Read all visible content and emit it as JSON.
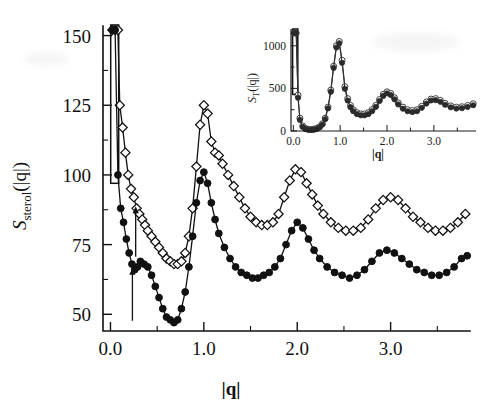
{
  "figure": {
    "name": "sterol-structure-factor-figure",
    "background_color": "#ffffff",
    "ink_color": "#111111"
  },
  "main_axes": {
    "y_label_symbol": "S",
    "y_label_subscript": "sterol",
    "y_label_arg": "(|q|)",
    "x_label": "|q|",
    "y_ticks": [
      "50",
      "75",
      "100",
      "125",
      "150"
    ],
    "x_ticks": [
      "0.0",
      "1.0",
      "2.0",
      "3.0"
    ],
    "y_tick_values": [
      50,
      75,
      100,
      125,
      150
    ],
    "x_tick_values": [
      0.0,
      1.0,
      2.0,
      3.0
    ],
    "x_minor_tick_values": [
      0.5,
      1.5,
      2.5,
      3.5
    ],
    "y_minor_tick_values": [
      62.5,
      87.5,
      112.5,
      137.5
    ],
    "xlim": [
      -0.08,
      3.85
    ],
    "ylim": [
      44,
      152
    ]
  },
  "inset_axes": {
    "y_label_symbol": "S",
    "y_label_subscript": "T",
    "y_label_arg": "(|q|)",
    "x_label": "|q|",
    "y_ticks": [
      "0",
      "500",
      "1000"
    ],
    "x_ticks": [
      "0.0",
      "1.0",
      "2.0",
      "3.0"
    ],
    "y_tick_values": [
      0,
      500,
      1000
    ],
    "x_tick_values": [
      0.0,
      1.0,
      2.0,
      3.0
    ],
    "x_minor_tick_values": [
      0.5,
      1.5,
      2.5,
      3.5
    ],
    "xlim": [
      -0.05,
      3.9
    ],
    "ylim": [
      0,
      1150
    ]
  },
  "annotations": {
    "arrow_open_series": {
      "label": "shoulder-arrow-upper",
      "x": 0.27,
      "y_tip": 88,
      "y_tail": 80
    },
    "arrow_filled_series": {
      "label": "shoulder-arrow-lower",
      "x": 0.235,
      "y_tip": 66,
      "y_tail": 57
    }
  },
  "chart_data": {
    "type": "line",
    "title": "",
    "xlabel": "|q|",
    "ylabel": "S_sterol(|q|)",
    "xlim": [
      -0.08,
      3.85
    ],
    "ylim": [
      44,
      152
    ],
    "grid": false,
    "legend": "none",
    "series": [
      {
        "name": "S_sterol open diamonds",
        "marker": "open-diamond",
        "clipped_above": 150,
        "x": [
          0.02,
          0.05,
          0.08,
          0.1,
          0.13,
          0.16,
          0.19,
          0.22,
          0.25,
          0.28,
          0.31,
          0.34,
          0.37,
          0.4,
          0.44,
          0.48,
          0.52,
          0.56,
          0.6,
          0.64,
          0.68,
          0.72,
          0.76,
          0.8,
          0.84,
          0.88,
          0.92,
          0.96,
          1.0,
          1.04,
          1.08,
          1.12,
          1.16,
          1.2,
          1.26,
          1.32,
          1.38,
          1.44,
          1.5,
          1.56,
          1.62,
          1.68,
          1.74,
          1.8,
          1.86,
          1.92,
          1.98,
          2.04,
          2.1,
          2.16,
          2.22,
          2.28,
          2.36,
          2.44,
          2.52,
          2.6,
          2.68,
          2.76,
          2.84,
          2.92,
          3.0,
          3.08,
          3.16,
          3.24,
          3.32,
          3.4,
          3.48,
          3.56,
          3.64,
          3.72,
          3.8
        ],
        "y": [
          152,
          152,
          152,
          125,
          117,
          108,
          100,
          95,
          92,
          88,
          86,
          84,
          82,
          80,
          78,
          76,
          74,
          72,
          70,
          69,
          68,
          68,
          69,
          72,
          78,
          88,
          103,
          118,
          125,
          122,
          112,
          108,
          107,
          104,
          100,
          96,
          92,
          88,
          85,
          83,
          82,
          82,
          83,
          86,
          92,
          98,
          102,
          101,
          97,
          93,
          89,
          86,
          83,
          81,
          80,
          80,
          81,
          84,
          88,
          91,
          92,
          91,
          88,
          85,
          83,
          81,
          80,
          80,
          81,
          83,
          86
        ]
      },
      {
        "name": "S_sterol filled circles",
        "marker": "filled-circle",
        "clipped_above": 150,
        "x": [
          0.02,
          0.05,
          0.08,
          0.11,
          0.14,
          0.17,
          0.2,
          0.23,
          0.26,
          0.29,
          0.32,
          0.36,
          0.4,
          0.44,
          0.48,
          0.52,
          0.56,
          0.6,
          0.64,
          0.68,
          0.72,
          0.76,
          0.8,
          0.84,
          0.88,
          0.92,
          0.96,
          1.0,
          1.04,
          1.08,
          1.12,
          1.16,
          1.22,
          1.28,
          1.34,
          1.4,
          1.46,
          1.52,
          1.58,
          1.64,
          1.7,
          1.76,
          1.82,
          1.88,
          1.94,
          2.0,
          2.06,
          2.12,
          2.18,
          2.24,
          2.32,
          2.4,
          2.48,
          2.56,
          2.64,
          2.72,
          2.8,
          2.88,
          2.96,
          3.04,
          3.12,
          3.2,
          3.28,
          3.36,
          3.44,
          3.52,
          3.6,
          3.68,
          3.76,
          3.82
        ],
        "y": [
          152,
          152,
          100,
          88,
          83,
          77,
          72,
          68,
          66,
          67,
          69,
          68,
          67,
          64,
          60,
          56,
          52,
          49,
          48,
          47,
          48,
          52,
          58,
          67,
          78,
          90,
          98,
          101,
          97,
          90,
          84,
          79,
          74,
          70,
          67,
          65,
          64,
          63,
          63,
          64,
          65,
          67,
          70,
          75,
          80,
          83,
          81,
          77,
          73,
          70,
          67,
          65,
          64,
          63,
          64,
          66,
          69,
          72,
          73,
          72,
          70,
          68,
          66,
          65,
          64,
          64,
          65,
          67,
          70,
          71
        ]
      }
    ]
  },
  "inset_chart_data": {
    "type": "line",
    "title": "",
    "xlabel": "|q|",
    "ylabel": "S_T(|q|)",
    "xlim": [
      -0.05,
      3.9
    ],
    "ylim": [
      0,
      1150
    ],
    "grid": false,
    "legend": "none",
    "series": [
      {
        "name": "S_T open circles",
        "marker": "open-circle",
        "clipped_above": 1100,
        "x": [
          0.02,
          0.06,
          0.1,
          0.14,
          0.2,
          0.26,
          0.32,
          0.38,
          0.44,
          0.5,
          0.56,
          0.62,
          0.68,
          0.74,
          0.8,
          0.86,
          0.92,
          0.98,
          1.04,
          1.1,
          1.16,
          1.22,
          1.28,
          1.36,
          1.44,
          1.52,
          1.6,
          1.68,
          1.76,
          1.84,
          1.92,
          2.0,
          2.08,
          2.16,
          2.24,
          2.34,
          2.44,
          2.54,
          2.64,
          2.74,
          2.84,
          2.94,
          3.04,
          3.14,
          3.24,
          3.36,
          3.48,
          3.6,
          3.72,
          3.84
        ],
        "y": [
          1150,
          1150,
          420,
          150,
          60,
          30,
          20,
          18,
          22,
          32,
          50,
          85,
          150,
          280,
          480,
          760,
          1000,
          1050,
          830,
          520,
          380,
          300,
          250,
          215,
          200,
          200,
          215,
          250,
          300,
          370,
          430,
          460,
          440,
          390,
          330,
          280,
          250,
          240,
          250,
          290,
          340,
          375,
          380,
          360,
          325,
          295,
          280,
          285,
          300,
          320
        ]
      },
      {
        "name": "S_T filled circles",
        "marker": "filled-circle",
        "clipped_above": 1100,
        "x": [
          0.02,
          0.06,
          0.1,
          0.14,
          0.2,
          0.26,
          0.32,
          0.38,
          0.44,
          0.5,
          0.56,
          0.62,
          0.68,
          0.74,
          0.8,
          0.86,
          0.92,
          0.98,
          1.04,
          1.1,
          1.16,
          1.22,
          1.28,
          1.36,
          1.44,
          1.52,
          1.6,
          1.68,
          1.76,
          1.84,
          1.92,
          2.0,
          2.08,
          2.16,
          2.24,
          2.34,
          2.44,
          2.54,
          2.64,
          2.74,
          2.84,
          2.94,
          3.04,
          3.14,
          3.24,
          3.36,
          3.48,
          3.6,
          3.72,
          3.84
        ],
        "y": [
          1150,
          1150,
          390,
          130,
          48,
          22,
          14,
          12,
          16,
          25,
          42,
          75,
          138,
          265,
          460,
          740,
          980,
          1030,
          800,
          495,
          358,
          280,
          232,
          198,
          184,
          184,
          198,
          232,
          282,
          352,
          412,
          442,
          422,
          372,
          312,
          262,
          232,
          222,
          232,
          272,
          322,
          358,
          362,
          342,
          308,
          278,
          263,
          268,
          282,
          302
        ]
      }
    ]
  }
}
